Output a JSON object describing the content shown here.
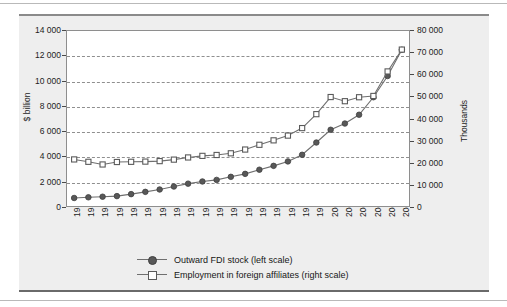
{
  "colors": {
    "panel_background": "#eeeeee",
    "plot_background": "#ffffff",
    "frame": "#8e8e8e",
    "gridline": "#8f8f8f",
    "series_line": "#6f6f6f",
    "fdi_marker_fill": "#585858",
    "employment_marker_fill": "#ffffff",
    "marker_edge": "#3f3f3f",
    "text": "#1d1d1d"
  },
  "legend": {
    "position": "bottom-center",
    "items": [
      {
        "label": "Outward FDI stock (left scale)",
        "marker": "filled-circle-marker",
        "scale": "left"
      },
      {
        "label": "Employment in foreign affiliates (right scale)",
        "marker": "open-square-marker",
        "scale": "right"
      }
    ]
  },
  "chart_data": {
    "type": "line",
    "title": "",
    "subtitle": "",
    "xlabel": "",
    "ylabel": "$ billion",
    "y2label": "Thousands",
    "ylim": [
      0,
      14000
    ],
    "y2lim": [
      0,
      80000
    ],
    "yticks": [
      "0",
      "2 000",
      "4 000",
      "6 000",
      "8 000",
      "10 000",
      "12 000",
      "14 000"
    ],
    "ytick_values": [
      0,
      2000,
      4000,
      6000,
      8000,
      10000,
      12000,
      14000
    ],
    "y2ticks": [
      "0",
      "10 000",
      "20 000",
      "30 000",
      "40 000",
      "50 000",
      "60 000",
      "70 000",
      "80 000"
    ],
    "y2tick_values": [
      0,
      10000,
      20000,
      30000,
      40000,
      50000,
      60000,
      70000,
      80000
    ],
    "grid": true,
    "grid_axis": "y",
    "legend_position": "bottom",
    "categories": [
      "1982",
      "1983",
      "1984",
      "1985",
      "1986",
      "1987",
      "1988",
      "1989",
      "1990",
      "1991",
      "1992",
      "1993",
      "1994",
      "1995",
      "1996",
      "1997",
      "1998",
      "1999",
      "2000",
      "2001",
      "2002",
      "2003",
      "2005",
      "2006"
    ],
    "series": [
      {
        "name": "Outward FDI stock (left scale)",
        "axis": "left",
        "unit": "$ billion",
        "marker": "filled-circle-marker",
        "values": [
          640,
          700,
          740,
          790,
          950,
          1130,
          1320,
          1560,
          1790,
          1960,
          2090,
          2330,
          2570,
          2900,
          3210,
          3570,
          4100,
          5080,
          6100,
          6600,
          7300,
          8700,
          10400,
          12500
        ]
      },
      {
        "name": "Employment in foreign affiliates (right scale)",
        "axis": "right",
        "unit": "Thousands",
        "marker": "open-square-marker",
        "values": [
          21300,
          20200,
          19000,
          20100,
          20200,
          20300,
          20500,
          21200,
          22200,
          22900,
          23300,
          24100,
          25800,
          28000,
          30000,
          32200,
          35600,
          42000,
          49800,
          47900,
          49700,
          50300,
          61500,
          71500
        ]
      }
    ]
  }
}
